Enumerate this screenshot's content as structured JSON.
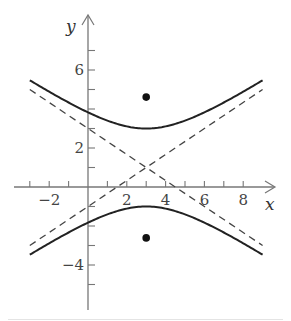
{
  "chart_data": {
    "type": "line",
    "title": "",
    "xlabel": "x",
    "ylabel": "y",
    "xlim": [
      -3,
      9
    ],
    "ylim": [
      -6,
      8.5
    ],
    "x_ticks": [
      -3,
      -2,
      -1,
      1,
      2,
      3,
      4,
      5,
      6,
      7,
      8
    ],
    "x_tick_labels": [
      {
        "value": -2,
        "text": "−2"
      },
      {
        "value": 2,
        "text": "2"
      },
      {
        "value": 4,
        "text": "4"
      },
      {
        "value": 6,
        "text": "6"
      },
      {
        "value": 8,
        "text": "8"
      }
    ],
    "y_ticks": [
      -5,
      -4,
      -3,
      -2,
      -1,
      1,
      2,
      3,
      4,
      5,
      6,
      7
    ],
    "y_tick_labels": [
      {
        "value": -4,
        "text": "−4"
      },
      {
        "value": 2,
        "text": "2"
      },
      {
        "value": 6,
        "text": "6"
      }
    ],
    "grid": false,
    "equation": "(y-1)^2/4 - (x-3)^2/9 = 1",
    "center": [
      3,
      1
    ],
    "vertices": [
      [
        3,
        3
      ],
      [
        3,
        -1
      ]
    ],
    "foci": [
      [
        3,
        4.61
      ],
      [
        3,
        -2.61
      ]
    ],
    "series": [
      {
        "name": "upper branch",
        "style": "solid",
        "x_range": [
          -3,
          9
        ],
        "formula": "y = 1 + 2*sqrt(1 + (x-3)^2/9)"
      },
      {
        "name": "lower branch",
        "style": "solid",
        "x_range": [
          -3,
          9
        ],
        "formula": "y = 1 - 2*sqrt(1 + (x-3)^2/9)"
      },
      {
        "name": "asymptote 1",
        "style": "dashed",
        "points": [
          [
            -3,
            -3
          ],
          [
            9,
            5
          ]
        ],
        "formula": "y = 1 + (2/3)(x-3)"
      },
      {
        "name": "asymptote 2",
        "style": "dashed",
        "points": [
          [
            -3,
            5
          ],
          [
            9,
            -3
          ]
        ],
        "formula": "y = 1 - (2/3)(x-3)"
      },
      {
        "name": "foci",
        "style": "points",
        "points": [
          [
            3,
            4.61
          ],
          [
            3,
            -2.61
          ]
        ]
      }
    ]
  },
  "axes": {
    "x_label": "x",
    "y_label": "y"
  },
  "colors": {
    "curve": "#222222",
    "asymptote": "#444444",
    "axis": "#777777",
    "focus": "#111111"
  }
}
